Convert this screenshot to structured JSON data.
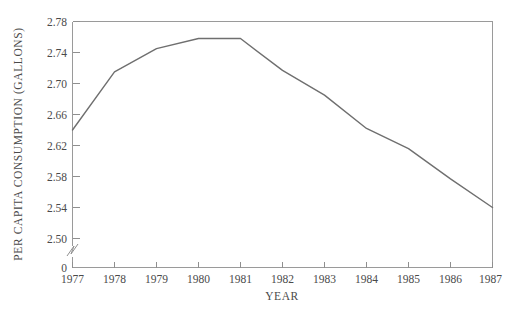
{
  "chart_data": {
    "type": "line",
    "title": "",
    "xlabel": "YEAR",
    "ylabel": "PER CAPITA CONSUMPTION (GALLONS)",
    "categories": [
      "1977",
      "1978",
      "1979",
      "1980",
      "1981",
      "1982",
      "1983",
      "1984",
      "1985",
      "1986",
      "1987"
    ],
    "x": [
      1977,
      1978,
      1979,
      1980,
      1981,
      1982,
      1983,
      1984,
      1985,
      1986,
      1987
    ],
    "values": [
      2.64,
      2.715,
      2.745,
      2.758,
      2.758,
      2.717,
      2.685,
      2.642,
      2.616,
      2.577,
      2.54
    ],
    "series": [
      {
        "name": "per-capita-consumption",
        "values": [
          2.64,
          2.715,
          2.745,
          2.758,
          2.758,
          2.717,
          2.685,
          2.642,
          2.616,
          2.577,
          2.54
        ]
      }
    ],
    "xlim": [
      1977,
      1987
    ],
    "ylim": [
      2.5,
      2.78
    ],
    "ytick_labels": [
      "2.78",
      "2.74",
      "2.70",
      "2.66",
      "2.62",
      "2.58",
      "2.54",
      "2.50",
      "0"
    ],
    "ytick_values": [
      2.78,
      2.74,
      2.7,
      2.66,
      2.62,
      2.58,
      2.54,
      2.5,
      0
    ],
    "xtick_labels": [
      "1977",
      "1978",
      "1979",
      "1980",
      "1981",
      "1982",
      "1983",
      "1984",
      "1985",
      "1986",
      "1987"
    ],
    "grid": false,
    "legend": "none",
    "axis_break": true,
    "axis_break_note": "y-axis broken between 2.50 and 0",
    "line_color": "#6f6f6f",
    "axis_color": "#9a9a9a",
    "background_color": "#ffffff"
  },
  "axis_titles": {
    "x": "YEAR",
    "y": "PER CAPITA CONSUMPTION (GALLONS)"
  }
}
